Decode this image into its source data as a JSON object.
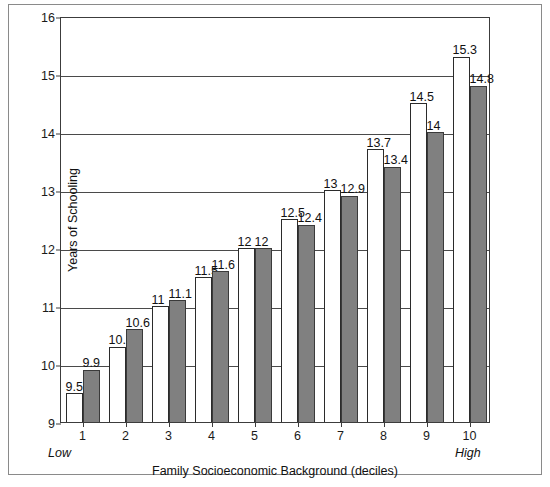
{
  "chart_data": {
    "type": "bar",
    "title": "",
    "xlabel": "Family Socioeconomic Background (deciles)",
    "ylabel": "Years of Schooling",
    "categories": [
      "1",
      "2",
      "3",
      "4",
      "5",
      "6",
      "7",
      "8",
      "9",
      "10"
    ],
    "series": [
      {
        "name": "light",
        "values": [
          9.5,
          10.3,
          11,
          11.5,
          12,
          12.5,
          13,
          13.7,
          14.5,
          15.3
        ],
        "labels": [
          "9.5",
          "10.3",
          "11",
          "11.5",
          "12",
          "12.5",
          "13",
          "13.7",
          "14.5",
          "15.3"
        ],
        "color": "#ffffff"
      },
      {
        "name": "dark",
        "values": [
          9.9,
          10.6,
          11.1,
          11.6,
          12,
          12.4,
          12.9,
          13.4,
          14,
          14.8
        ],
        "labels": [
          "9.9",
          "10.6",
          "11.1",
          "11.6",
          "12",
          "12.4",
          "12.9",
          "13.4",
          "14",
          "14.8"
        ],
        "color": "#808080"
      }
    ],
    "ylim": [
      9,
      16
    ],
    "yticks": [
      9,
      10,
      11,
      12,
      13,
      14,
      15,
      16
    ],
    "ytick_labels": [
      "9",
      "10",
      "11",
      "12",
      "13",
      "14",
      "15",
      "16"
    ],
    "grid": true,
    "legend": "none",
    "annotations": {
      "x_axis_low": "Low",
      "x_axis_high": "High"
    }
  }
}
